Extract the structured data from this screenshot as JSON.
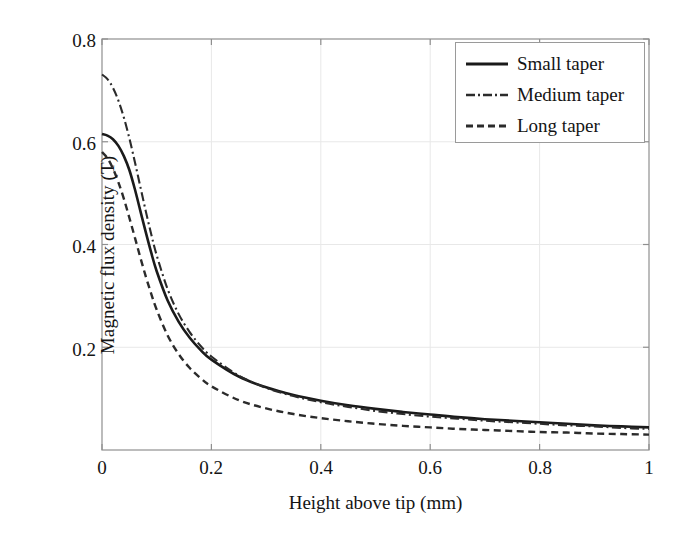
{
  "chart_data": {
    "type": "line",
    "title": "",
    "subtitle": "",
    "xlabel": "Height above tip (mm)",
    "ylabel": "Magnetic flux density (T)",
    "xlim": [
      0,
      1
    ],
    "ylim": [
      0,
      0.8
    ],
    "xticks": [
      "0",
      "0.2",
      "0.4",
      "0.6",
      "0.8",
      "1"
    ],
    "xtick_values": [
      0,
      0.2,
      0.4,
      0.6,
      0.8,
      1
    ],
    "yticks": [
      "0.2",
      "0.4",
      "0.6",
      "0.8"
    ],
    "ytick_values": [
      0.2,
      0.4,
      0.6,
      0.8
    ],
    "grid": true,
    "grid_color": "#e8e8e8",
    "axis_color": "#8f8f8f",
    "legend_position": "top-right",
    "x": [
      0,
      0.01,
      0.02,
      0.03,
      0.04,
      0.05,
      0.06,
      0.07,
      0.08,
      0.09,
      0.1,
      0.12,
      0.14,
      0.16,
      0.18,
      0.2,
      0.25,
      0.3,
      0.35,
      0.4,
      0.45,
      0.5,
      0.55,
      0.6,
      0.65,
      0.7,
      0.75,
      0.8,
      0.85,
      0.9,
      0.95,
      1
    ],
    "series": [
      {
        "name": "Small taper",
        "style": "solid",
        "color": "#1a1a1a",
        "width": 2.6,
        "values": [
          0.615,
          0.612,
          0.605,
          0.592,
          0.572,
          0.545,
          0.508,
          0.466,
          0.424,
          0.384,
          0.348,
          0.291,
          0.25,
          0.219,
          0.195,
          0.176,
          0.143,
          0.122,
          0.107,
          0.096,
          0.087,
          0.08,
          0.074,
          0.069,
          0.064,
          0.06,
          0.057,
          0.054,
          0.051,
          0.048,
          0.046,
          0.044
        ]
      },
      {
        "name": "Medium taper",
        "style": "dashdot",
        "color": "#2b2b2b",
        "width": 2.1,
        "values": [
          0.731,
          0.722,
          0.705,
          0.68,
          0.647,
          0.607,
          0.561,
          0.513,
          0.465,
          0.42,
          0.379,
          0.313,
          0.265,
          0.23,
          0.203,
          0.182,
          0.145,
          0.121,
          0.105,
          0.093,
          0.084,
          0.076,
          0.07,
          0.065,
          0.061,
          0.057,
          0.054,
          0.051,
          0.048,
          0.046,
          0.043,
          0.041
        ]
      },
      {
        "name": "Long taper",
        "style": "dashed",
        "color": "#2b2b2b",
        "width": 2.4,
        "values": [
          0.58,
          0.568,
          0.548,
          0.521,
          0.489,
          0.452,
          0.414,
          0.375,
          0.338,
          0.304,
          0.273,
          0.223,
          0.187,
          0.16,
          0.14,
          0.124,
          0.097,
          0.081,
          0.07,
          0.062,
          0.056,
          0.051,
          0.047,
          0.044,
          0.041,
          0.039,
          0.037,
          0.035,
          0.034,
          0.032,
          0.031,
          0.03
        ]
      }
    ]
  },
  "legend": {
    "items": [
      {
        "label": "Small taper",
        "style": "solid"
      },
      {
        "label": "Medium taper",
        "style": "dashdot"
      },
      {
        "label": "Long taper",
        "style": "dashed"
      }
    ]
  }
}
